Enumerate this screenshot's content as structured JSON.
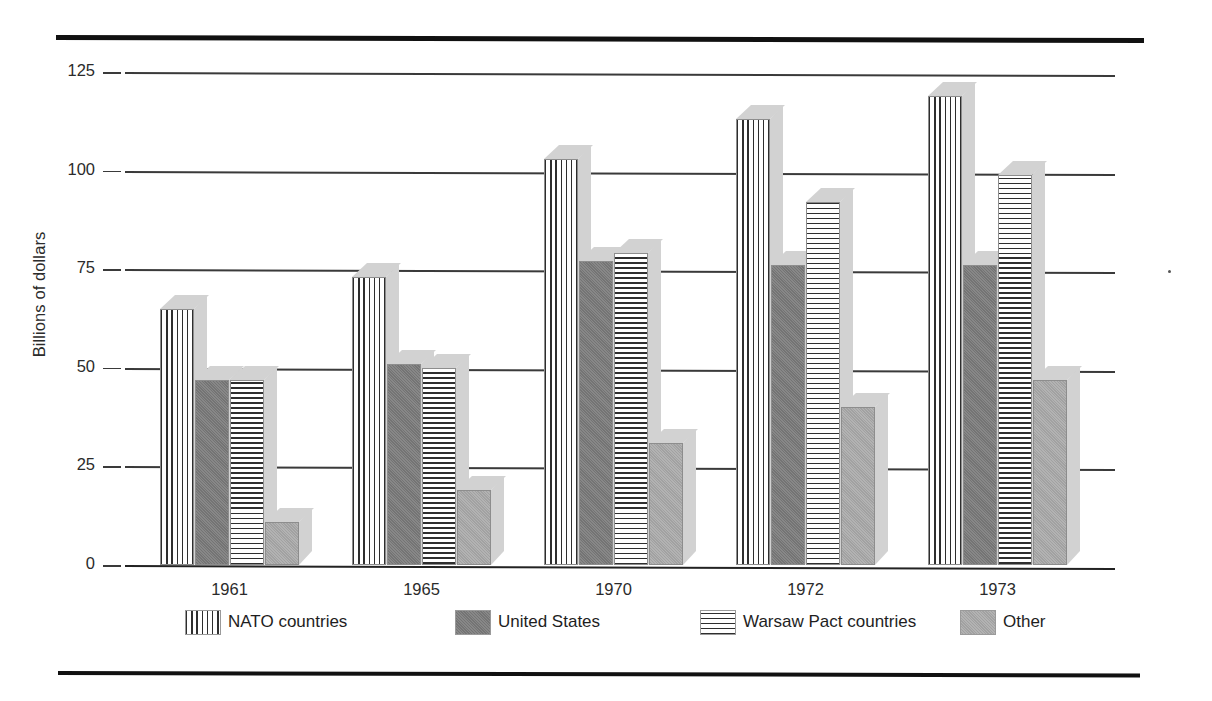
{
  "chart_data": {
    "type": "bar",
    "title": "",
    "xlabel": "",
    "ylabel": "Billions of dollars",
    "ylim": [
      0,
      125
    ],
    "yticks": [
      0,
      25,
      50,
      75,
      100,
      125
    ],
    "ytick_labels": [
      "0",
      "25",
      "50",
      "75",
      "100",
      "125"
    ],
    "grid": true,
    "legend_position": "bottom",
    "categories": [
      "1961",
      "1965",
      "1970",
      "1972",
      "1973"
    ],
    "series": [
      {
        "name": "NATO countries",
        "pattern": "vertical-stripes",
        "values": [
          65,
          73,
          103,
          113,
          119
        ]
      },
      {
        "name": "United States",
        "pattern": "solid-dark-gray",
        "values": [
          47,
          51,
          77,
          76,
          76
        ]
      },
      {
        "name": "Warsaw Pact countries",
        "pattern": "horizontal-stripes",
        "values": [
          47,
          50,
          79,
          92,
          99
        ]
      },
      {
        "name": "Other",
        "pattern": "solid-medium-gray",
        "values": [
          11,
          19,
          31,
          40,
          47
        ]
      }
    ]
  },
  "axis": {
    "y_title": "Billions of dollars",
    "ticks": [
      "125",
      "100",
      "75",
      "50",
      "25",
      "0"
    ],
    "x_categories": [
      "1961",
      "1965",
      "1970",
      "1972",
      "1973"
    ]
  },
  "legend": {
    "items": [
      {
        "label": "NATO countries"
      },
      {
        "label": "United States"
      },
      {
        "label": "Warsaw Pact countries"
      },
      {
        "label": "Other"
      }
    ]
  },
  "colors": {
    "stripe_ink": "#2e2e2e",
    "united_states": "#7a7a7a",
    "other": "#a8a8a8",
    "extrusion": "#d2d2d2",
    "rule": "#111111",
    "gridline": "#3a3a3a"
  }
}
